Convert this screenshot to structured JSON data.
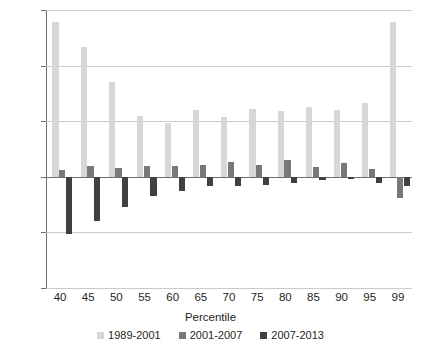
{
  "chart_data": {
    "type": "bar",
    "title": "",
    "xlabel": "Percentile",
    "ylabel": "",
    "categories": [
      "40",
      "45",
      "50",
      "55",
      "60",
      "65",
      "70",
      "75",
      "80",
      "85",
      "90",
      "95",
      "99"
    ],
    "series": [
      {
        "name": "1989-2001",
        "color": "#d6d7d8",
        "values": [
          139,
          117,
          85,
          55,
          48,
          60,
          54,
          61,
          59,
          63,
          60,
          66,
          139
        ]
      },
      {
        "name": "2001-2007",
        "color": "#77787b",
        "values": [
          6,
          10,
          8,
          10,
          10,
          11,
          13,
          11,
          15,
          9,
          12,
          7,
          -19
        ]
      },
      {
        "name": "2007-2013",
        "color": "#404041",
        "values": [
          -51,
          -40,
          -27,
          -17,
          -13,
          -8,
          -8,
          -7,
          -6,
          -3,
          -2,
          -6,
          -8
        ]
      }
    ],
    "ylim": [
      -100,
      150
    ],
    "yticks": [
      150,
      100,
      50,
      0,
      -50,
      -100
    ],
    "ytick_labels": [
      "150",
      "100",
      "50",
      "0",
      "−50",
      "−100"
    ],
    "grid": true,
    "legend_position": "bottom"
  },
  "axis": {
    "x_title": "Percentile"
  }
}
